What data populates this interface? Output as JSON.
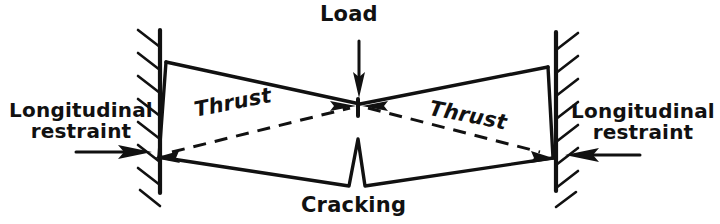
{
  "diagram": {
    "ink_color": "#111111",
    "background_color": "#ffffff",
    "labels": {
      "load": "Load",
      "cracking": "Cracking",
      "thrust_left": "Thrust",
      "thrust_right": "Thrust",
      "restraint_left_line1": "Longitudinal",
      "restraint_left_line2": "restraint",
      "restraint_right_line1": "Longitudinal",
      "restraint_right_line2": "restraint"
    },
    "icons": {
      "load_arrow": "arrow-down-icon",
      "restraint_left_arrow": "arrow-right-icon",
      "restraint_right_arrow": "arrow-left-icon",
      "thrust_left_arrow_out": "arrow-left-icon",
      "thrust_left_arrow_in": "arrow-right-icon",
      "thrust_right_arrow_in": "arrow-left-icon",
      "thrust_right_arrow_out": "arrow-right-icon",
      "support_left": "fixed-support-hatching-icon",
      "support_right": "fixed-support-hatching-icon",
      "crack_notch": "crack-wedge-icon"
    },
    "geometry": {
      "wall_left_x": 160,
      "wall_right_x": 556,
      "wall_top_y": 30,
      "wall_bottom_y": 192,
      "top_chord": "165,63 360,103 548,68",
      "bottom_chord": "157,157 348,186 364,186 553,159",
      "crack_apex": "358,138",
      "thrust_path": "157,155 358,107 552,157"
    }
  }
}
